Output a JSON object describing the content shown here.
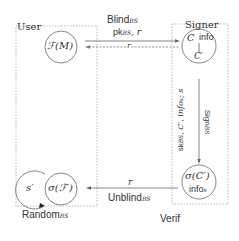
{
  "diagram": {
    "type": "protocol-flow",
    "parties": {
      "user": {
        "label": "User"
      },
      "signer": {
        "label": "Signer"
      }
    },
    "nodes": {
      "fm": {
        "label": "ℱ(M)"
      },
      "signer_state": {
        "top_left": "C",
        "top_right": "info",
        "bottom": "C′"
      },
      "signature": {
        "top": "σ(C′)",
        "bottom": "info",
        "bottom_sub": "s"
      },
      "s_prime": {
        "label": "s′"
      },
      "sigma_f": {
        "label": "σ(ℱ′)"
      }
    },
    "edges": {
      "blind": {
        "label": "Blind",
        "sub": "BS",
        "args_pk": "pk",
        "args_pk_sub": "BS",
        "args_rest": ", r"
      },
      "return_r": {
        "label": "r"
      },
      "sign": {
        "label": "Sign",
        "sub": "BS",
        "args": "sk",
        "args_sub": "BS",
        "args_rest": ", C′, info",
        "args_rest_sub": "s",
        "args_tail": "; s"
      },
      "unblind": {
        "top": "r",
        "label": "Unblind",
        "sub": "BS"
      },
      "random": {
        "label": "Random",
        "sub": "BS"
      }
    },
    "footer": {
      "verif": "Verif"
    }
  }
}
